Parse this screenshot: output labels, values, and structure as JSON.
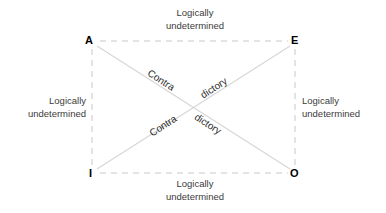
{
  "diagram": {
    "type": "square-of-opposition",
    "vertices": [
      {
        "id": "A",
        "label": "A",
        "x": 92,
        "y": 41
      },
      {
        "id": "E",
        "label": "E",
        "x": 295,
        "y": 41
      },
      {
        "id": "I",
        "label": "I",
        "x": 92,
        "y": 174
      },
      {
        "id": "O",
        "label": "O",
        "x": 295,
        "y": 174
      }
    ],
    "edge_labels": {
      "top": {
        "line1": "Logically",
        "line2": "undetermined"
      },
      "bottom": {
        "line1": "Logically",
        "line2": "undetermined"
      },
      "left": {
        "line1": "Logically",
        "line2": "undetermined"
      },
      "right": {
        "line1": "Logically",
        "line2": "undetermined"
      }
    },
    "diagonal_labels": {
      "ao_first": "Contra",
      "ao_second": "dictory",
      "ie_first": "Contra",
      "ie_second": "dictory"
    },
    "colors": {
      "background": "#ffffff",
      "dashed_edge": "#c8c8c8",
      "diagonal_line": "#d6d6d6",
      "vertex_text": "#000000",
      "edge_label_text": "#3b3b3b",
      "diagonal_label_text": "#2b2b2b"
    },
    "geometry": {
      "left_x": 92,
      "right_x": 295,
      "top_y": 41,
      "bottom_y": 173,
      "center_x": 194,
      "center_y": 107,
      "dash_pattern": "6 5"
    }
  }
}
